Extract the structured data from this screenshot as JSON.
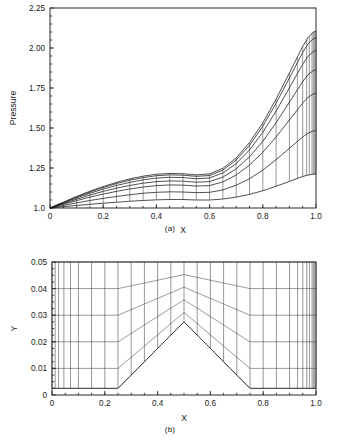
{
  "figure": {
    "panel_a": {
      "caption": "(a)",
      "xlabel": "X",
      "ylabel": "Pressure"
    },
    "panel_b": {
      "caption": "(b)",
      "xlabel": "X",
      "ylabel": "Y"
    }
  },
  "chart_data": [
    {
      "id": "panel-a",
      "type": "line",
      "title": "",
      "caption": "(a)",
      "xlabel": "X",
      "ylabel": "Pressure",
      "xlim": [
        0.0,
        1.0
      ],
      "ylim": [
        1.0,
        2.25
      ],
      "xticks": [
        0.0,
        0.2,
        0.4,
        0.6,
        0.8,
        1.0
      ],
      "xticklabels": [
        "0",
        "0.2",
        "0.4",
        "0.6",
        "0.8",
        "1.0"
      ],
      "yticks": [
        1.0,
        1.25,
        1.5,
        1.75,
        2.0,
        2.25
      ],
      "yticklabels": [
        "1.0",
        "1.25",
        "1.50",
        "1.75",
        "2.00",
        "2.25"
      ],
      "grid": false,
      "legend": "none",
      "description": "Family of pressure distributions along successive grid lines over a bump; curves fan from the wall (lowest) to the upper boundary (highest), all starting at Pressure = 1.0 at X = 0 and rising to a peak near X = 0.99.",
      "x": [
        0.0,
        0.02,
        0.05,
        0.1,
        0.15,
        0.2,
        0.25,
        0.3,
        0.35,
        0.4,
        0.45,
        0.5,
        0.55,
        0.6,
        0.65,
        0.7,
        0.75,
        0.8,
        0.85,
        0.9,
        0.95,
        0.97,
        0.99,
        1.0
      ],
      "series": [
        {
          "name": "wall-line-1",
          "values": [
            1.0,
            1.003,
            1.008,
            1.016,
            1.023,
            1.03,
            1.036,
            1.042,
            1.047,
            1.051,
            1.053,
            1.053,
            1.05,
            1.05,
            1.056,
            1.068,
            1.085,
            1.108,
            1.136,
            1.166,
            1.197,
            1.206,
            1.211,
            1.212
          ]
        },
        {
          "name": "line-2",
          "values": [
            1.0,
            1.006,
            1.016,
            1.032,
            1.047,
            1.06,
            1.072,
            1.083,
            1.092,
            1.098,
            1.101,
            1.1,
            1.096,
            1.098,
            1.113,
            1.142,
            1.183,
            1.237,
            1.302,
            1.373,
            1.444,
            1.468,
            1.482,
            1.484
          ]
        },
        {
          "name": "line-3",
          "values": [
            1.0,
            1.009,
            1.023,
            1.046,
            1.068,
            1.087,
            1.104,
            1.119,
            1.131,
            1.14,
            1.144,
            1.143,
            1.137,
            1.14,
            1.163,
            1.206,
            1.268,
            1.348,
            1.444,
            1.55,
            1.656,
            1.692,
            1.713,
            1.716
          ]
        },
        {
          "name": "line-4",
          "values": [
            1.0,
            1.011,
            1.027,
            1.055,
            1.081,
            1.104,
            1.124,
            1.141,
            1.155,
            1.165,
            1.169,
            1.168,
            1.161,
            1.165,
            1.193,
            1.245,
            1.32,
            1.417,
            1.533,
            1.661,
            1.79,
            1.833,
            1.859,
            1.863
          ]
        },
        {
          "name": "line-5",
          "values": [
            1.0,
            1.013,
            1.031,
            1.063,
            1.092,
            1.118,
            1.141,
            1.16,
            1.176,
            1.187,
            1.192,
            1.19,
            1.183,
            1.188,
            1.219,
            1.278,
            1.363,
            1.473,
            1.606,
            1.751,
            1.899,
            1.948,
            1.978,
            1.983
          ]
        },
        {
          "name": "line-6",
          "values": [
            1.0,
            1.014,
            1.034,
            1.069,
            1.1,
            1.128,
            1.153,
            1.174,
            1.19,
            1.202,
            1.207,
            1.205,
            1.198,
            1.203,
            1.237,
            1.3,
            1.392,
            1.511,
            1.655,
            1.812,
            1.972,
            2.025,
            2.058,
            2.063
          ]
        },
        {
          "name": "upper-boundary",
          "values": [
            1.0,
            1.015,
            1.036,
            1.072,
            1.105,
            1.134,
            1.16,
            1.182,
            1.199,
            1.211,
            1.216,
            1.214,
            1.207,
            1.213,
            1.248,
            1.313,
            1.409,
            1.532,
            1.681,
            1.844,
            2.01,
            2.065,
            2.1,
            2.105
          ]
        }
      ],
      "transverse_mesh_x": [
        0.05,
        0.1,
        0.15,
        0.2,
        0.25,
        0.3,
        0.35,
        0.4,
        0.45,
        0.5,
        0.55,
        0.6,
        0.65,
        0.7,
        0.75,
        0.8,
        0.85,
        0.9,
        0.93,
        0.95,
        0.965,
        0.975,
        0.985,
        0.99,
        0.995,
        1.0
      ]
    },
    {
      "id": "panel-b",
      "type": "line",
      "title": "",
      "caption": "(b)",
      "xlabel": "X",
      "ylabel": "Y",
      "xlim": [
        0.0,
        1.0
      ],
      "ylim": [
        0.0,
        0.05
      ],
      "xticks": [
        0.0,
        0.2,
        0.4,
        0.6,
        0.8,
        1.0
      ],
      "xticklabels": [
        "0",
        "0.2",
        "0.4",
        "0.6",
        "0.8",
        "1.0"
      ],
      "yticks": [
        0.0,
        0.01,
        0.02,
        0.03,
        0.04,
        0.05
      ],
      "yticklabels": [
        "0",
        "0.01",
        "0.02",
        "0.03",
        "0.04",
        "0.05"
      ],
      "grid": false,
      "legend": "none",
      "description": "Structured computational grid over a tent-shaped bump. Lower wall is flat at Y=0.0025 for X<0.25, rises linearly to a peak Y=0.0275 at X=0.5, then falls back to Y=0.0025 at X=0.75 and stays flat to X=1.0. Upper boundary fixed at Y=0.05. Vertical grid lines are clustered near X=0 and strongly clustered near X=1.",
      "wall_profile": {
        "x": [
          0.0,
          0.25,
          0.5,
          0.75,
          1.0
        ],
        "y": [
          0.0025,
          0.0025,
          0.0275,
          0.0025,
          0.0025
        ]
      },
      "upper_boundary_y": 0.05,
      "horizontal_mesh_levels": [
        0.0025,
        0.01,
        0.02,
        0.03,
        0.04,
        0.05
      ],
      "peak_levels_at_center": [
        0.0275,
        0.035,
        0.04,
        0.045,
        0.05
      ],
      "vertical_mesh_x": [
        0.0,
        0.012,
        0.025,
        0.045,
        0.07,
        0.1,
        0.15,
        0.2,
        0.25,
        0.3,
        0.35,
        0.4,
        0.45,
        0.5,
        0.55,
        0.6,
        0.65,
        0.7,
        0.75,
        0.8,
        0.85,
        0.9,
        0.93,
        0.95,
        0.965,
        0.975,
        0.985,
        0.99,
        0.995,
        1.0
      ]
    }
  ]
}
